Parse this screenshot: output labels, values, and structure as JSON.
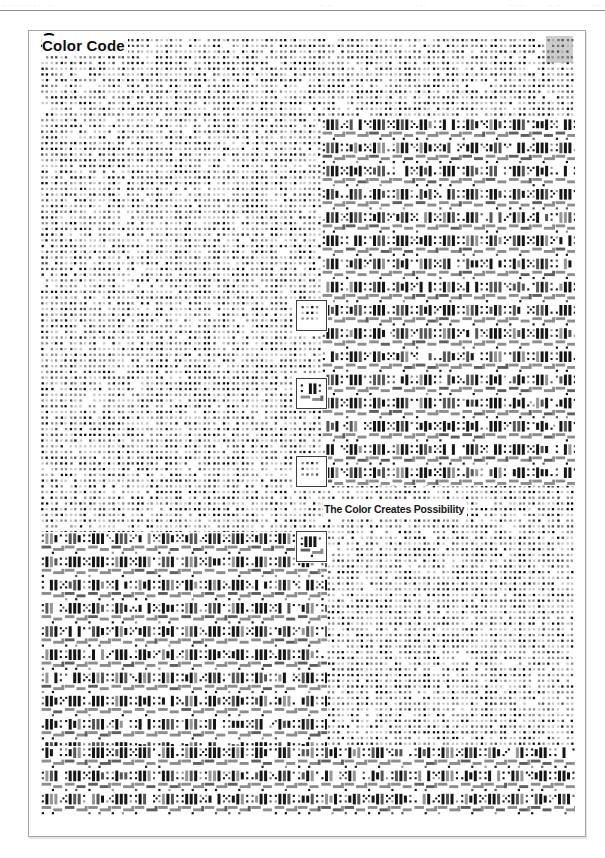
{
  "page": {
    "print_header": {
      "left_marks": "·· ····· ···· · · ··",
      "mid_marks_1": "·· ··",
      "mid_marks_2": "·· ··",
      "right_marks_1": "·· ···",
      "right_marks_2": "·· ··",
      "right_marks_3": "···"
    },
    "poster": {
      "title": "Color Code",
      "tagline": "The Color Creates Possibility"
    }
  },
  "colors": {
    "page_background": "#ffffff",
    "poster_border": "#a6a6a6",
    "header_rule": "#8e8e8e",
    "title_text": "#0e0e0e",
    "swatch_box_border": "#3f3f3f",
    "highlight_fill": "rgba(150,150,150,0.48)"
  },
  "pattern": {
    "seed": 1337,
    "canvas_w": 556,
    "canvas_h": 805,
    "margin": {
      "left": 12,
      "top": 8,
      "right": 546,
      "bottom": 785
    },
    "dots": {
      "pitch_x": 9.55,
      "pair_dx": 4.3,
      "pitch_y": 5.72,
      "size": 2.3,
      "colors": [
        "#101010",
        "#4c4c4c",
        "#8c8c8c",
        "#c6c6c6"
      ],
      "weights": [
        0.24,
        0.18,
        0.28,
        0.22
      ],
      "blank_chance": 0.08
    },
    "code": {
      "cell_w": 23.3,
      "cell_h": 23.2,
      "bar_colors": [
        "#161616",
        "#575757",
        "#969696"
      ],
      "bar_weights": [
        0.62,
        0.25,
        0.13
      ],
      "dash_colors": [
        "#8d8d8d",
        "#5f5f5f"
      ],
      "dash_weights": [
        0.78,
        0.22
      ]
    },
    "regions": [
      {
        "name": "code-top-right",
        "x": 293,
        "y": 87,
        "w": 253,
        "h": 368
      },
      {
        "name": "code-bottom-left",
        "x": 12,
        "y": 501,
        "w": 286,
        "h": 214
      },
      {
        "name": "code-bottom-full",
        "x": 12,
        "y": 715,
        "w": 534,
        "h": 70
      }
    ],
    "boxes": [
      {
        "x": 267,
        "y": 269,
        "w": 31,
        "h": 31,
        "content": "dots"
      },
      {
        "x": 267,
        "y": 347,
        "w": 31,
        "h": 31,
        "content": "code"
      },
      {
        "x": 267,
        "y": 425,
        "w": 31,
        "h": 31,
        "content": "dots"
      },
      {
        "x": 267,
        "y": 500,
        "w": 31,
        "h": 31,
        "content": "code"
      }
    ],
    "highlight": {
      "x": 517,
      "y": 5,
      "w": 27,
      "h": 27
    }
  }
}
